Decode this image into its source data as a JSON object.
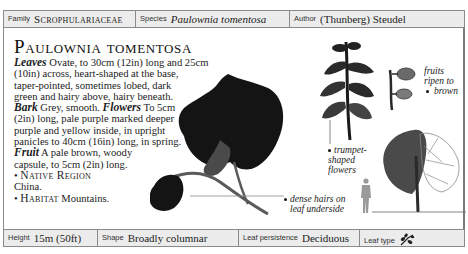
{
  "header": {
    "family_label": "Family",
    "family_value": "Scrophulariaceae",
    "species_label": "Species",
    "species_value": "Paulownia tomentosa",
    "author_label": "Author",
    "author_value": "(Thunberg) Steudel"
  },
  "title": "Paulownia tomentosa",
  "description": {
    "leaves_key": "Leaves",
    "leaves_l1": " Ovate, to 30cm (12in) long and 25cm",
    "leaves_l2": "(10in) across, heart-shaped at the base,",
    "leaves_l3": "taper-pointed, sometimes lobed, dark",
    "leaves_l4": "green and hairy above, hairy beneath.",
    "bark_key": "Bark",
    "bark_text": " Grey, smooth. ",
    "flowers_key": "Flowers",
    "flowers_l1": " To 5cm",
    "flowers_l2": "(2in) long, pale purple marked deeper",
    "flowers_l3": "purple and yellow inside, in upright",
    "flowers_l4": "panicles to 40cm (16in) long, in spring.",
    "fruit_key": "Fruit",
    "fruit_l1": " A pale brown, woody",
    "fruit_l2": "capsule, to 5cm (2in) long.",
    "native_key": "Native Region",
    "native_value": "China.",
    "habitat_key": "Habitat",
    "habitat_value": " Mountains."
  },
  "annotations": {
    "fruits_l1": "fruits",
    "fruits_l2": "ripen to",
    "fruits_l3": "brown",
    "trumpet_l1": "trumpet-",
    "trumpet_l2": "shaped",
    "trumpet_l3": "flowers",
    "hairs_l1": "dense hairs on",
    "hairs_l2": "leaf underside"
  },
  "footer": {
    "height_label": "Height",
    "height_value": "15m (50ft)",
    "shape_label": "Shape",
    "shape_value": "Broadly columnar",
    "persistence_label": "Leaf persistence",
    "persistence_value": "Deciduous",
    "leaftype_label": "Leaf type",
    "leaftype_icon": "compound-leaf-icon"
  },
  "colors": {
    "bar_background": "#ececec",
    "border": "#8a8a8a",
    "ink": "#1a1a1a",
    "leaf": "#141414",
    "silhouette": "#9a9a9a"
  }
}
